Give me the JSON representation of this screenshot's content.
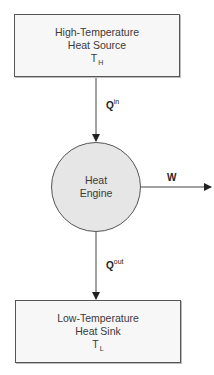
{
  "diagram": {
    "type": "heat-engine-schematic",
    "source": {
      "line1": "High-Temperature",
      "line2": "Heat Source",
      "symbol": "T",
      "subscript": "H"
    },
    "engine": {
      "line1": "Heat",
      "line2": "Engine"
    },
    "sink": {
      "line1": "Low-Temperature",
      "line2": "Heat Sink",
      "symbol": "T",
      "subscript": "L"
    },
    "flows": {
      "q_in": {
        "symbol": "Q",
        "superscript": "in"
      },
      "q_out": {
        "symbol": "Q",
        "superscript": "out"
      },
      "work": {
        "symbol": "W"
      }
    },
    "colors": {
      "stroke": "#555555",
      "box_fill": "#f7f7f7",
      "circle_fill": "#e6e6e6",
      "text": "#3a3a3a"
    }
  }
}
